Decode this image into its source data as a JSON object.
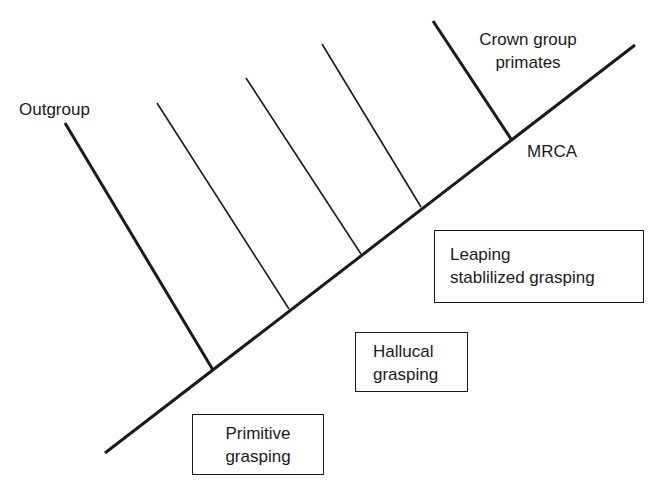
{
  "diagram": {
    "type": "cladogram",
    "colors": {
      "line": "#1a1a1a",
      "background": "#ffffff",
      "text": "#1a1a1a"
    },
    "trunk": {
      "x1": 105,
      "y1": 453,
      "x2": 635,
      "y2": 45,
      "stroke_width": 3
    },
    "branches": [
      {
        "id": "outgroup",
        "x1": 65,
        "y1": 123,
        "x2": 213,
        "y2": 370,
        "stroke_width": 3
      },
      {
        "id": "stem-1",
        "x1": 157,
        "y1": 103,
        "x2": 289,
        "y2": 309,
        "stroke_width": 1.6
      },
      {
        "id": "stem-2",
        "x1": 246,
        "y1": 78,
        "x2": 361,
        "y2": 254,
        "stroke_width": 1.6
      },
      {
        "id": "stem-3",
        "x1": 322,
        "y1": 44,
        "x2": 421,
        "y2": 207,
        "stroke_width": 1.6
      },
      {
        "id": "crown",
        "x1": 433,
        "y1": 21,
        "x2": 511,
        "y2": 139,
        "stroke_width": 3
      }
    ],
    "labels": {
      "outgroup": "Outgroup",
      "crown_line1": "Crown group",
      "crown_line2": "primates",
      "mrca": "MRCA"
    },
    "boxes": {
      "leaping": {
        "line1": "Leaping",
        "line2": "stablilized grasping"
      },
      "hallucal": {
        "line1": "Hallucal",
        "line2": "grasping"
      },
      "primitive": {
        "line1": "Primitive",
        "line2": "grasping"
      }
    }
  }
}
